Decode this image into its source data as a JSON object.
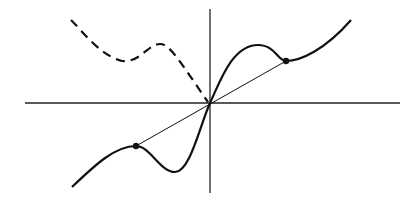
{
  "figure": {
    "colors": {
      "background": "#ffffff",
      "ink": "#111111",
      "axis": "#222222"
    },
    "axes": {
      "origin": [
        210,
        103
      ],
      "x_axis": {
        "from": [
          25,
          103
        ],
        "to": [
          400,
          103
        ]
      },
      "y_axis": {
        "from": [
          210,
          9
        ],
        "to": [
          210,
          193
        ]
      }
    },
    "curves": {
      "solid_curve_path": "M72,187 C95,165 115,146 136,146 C150,146 160,172 175,172 C190,172 200,125 210,103 C220,82 232,45 258,45 C275,45 278,61 286,61 C300,61 325,50 351,20",
      "dashed_curve_path": "M71,20 C85,34 100,55 122,61 C140,63 148,44 160,44 C170,44 180,62 208,102",
      "chord_path": "M136,146 L286,61"
    },
    "points": [
      {
        "name": "right-point",
        "x": 286,
        "y": 61
      },
      {
        "name": "left-point",
        "x": 136,
        "y": 146
      },
      {
        "name": "origin-point",
        "x": 210,
        "y": 103
      }
    ]
  }
}
